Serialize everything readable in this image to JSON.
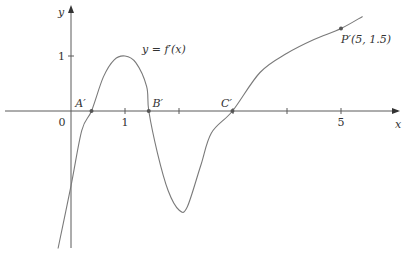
{
  "chart_data": {
    "type": "line",
    "title": "",
    "xlabel": "x",
    "ylabel": "y",
    "curve_label": "y = f′(x)",
    "grid": false,
    "x_ticks": [
      1,
      2,
      3,
      4,
      5
    ],
    "x_tick_labels": [
      {
        "x": 0,
        "label": "0"
      },
      {
        "x": 1,
        "label": "1"
      },
      {
        "x": 5,
        "label": "5"
      }
    ],
    "y_ticks": [
      1
    ],
    "y_tick_labels": [
      {
        "y": 1,
        "label": "1"
      }
    ],
    "xlim": [
      -1.3,
      6.2
    ],
    "ylim": [
      -2.5,
      2.0
    ],
    "series": [
      {
        "name": "f′(x)",
        "x": [
          -0.24,
          0,
          0.2,
          0.38,
          0.6,
          0.8,
          1.0,
          1.2,
          1.4,
          1.44,
          1.6,
          1.8,
          2.0,
          2.15,
          2.4,
          2.6,
          2.99,
          3.5,
          4.0,
          4.5,
          5.0,
          5.4
        ],
        "y": [
          -2.5,
          -1.36,
          -0.35,
          0,
          0.62,
          0.93,
          1.0,
          0.88,
          0.45,
          0,
          -0.76,
          -1.45,
          -1.8,
          -1.75,
          -1.0,
          -0.4,
          0,
          0.7,
          1.05,
          1.3,
          1.5,
          1.72
        ]
      }
    ],
    "points": [
      {
        "name": "A′",
        "x": 0.38,
        "y": 0,
        "label": "A′"
      },
      {
        "name": "B′",
        "x": 1.44,
        "y": 0,
        "label": "B′"
      },
      {
        "name": "C′",
        "x": 2.99,
        "y": 0,
        "label": "C′"
      },
      {
        "name": "P′",
        "x": 5,
        "y": 1.5,
        "label": "P′(5, 1.5)"
      }
    ]
  }
}
